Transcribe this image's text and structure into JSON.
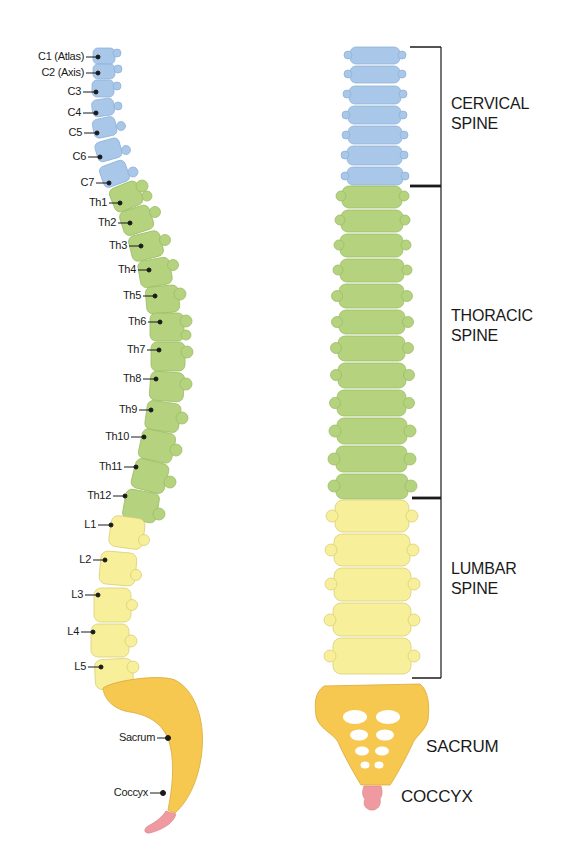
{
  "colors": {
    "cervical": "#a9c7e8",
    "cervical_edge": "#8fb2d8",
    "thoracic": "#b5d27e",
    "thoracic_edge": "#9cbd66",
    "lumbar": "#f7ef9a",
    "lumbar_edge": "#d9cf76",
    "sacrum": "#f6c84f",
    "sacrum_edge": "#d9a93a",
    "coccyx": "#ef9aa0",
    "bracket": "#1a1a1a"
  },
  "side_view": {
    "labels": [
      {
        "id": "c1",
        "text": "C1 (Atlas)"
      },
      {
        "id": "c2",
        "text": "C2 (Axis)"
      },
      {
        "id": "c3",
        "text": "C3"
      },
      {
        "id": "c4",
        "text": "C4"
      },
      {
        "id": "c5",
        "text": "C5"
      },
      {
        "id": "c6",
        "text": "C6"
      },
      {
        "id": "c7",
        "text": "C7"
      },
      {
        "id": "th1",
        "text": "Th1"
      },
      {
        "id": "th2",
        "text": "Th2"
      },
      {
        "id": "th3",
        "text": "Th3"
      },
      {
        "id": "th4",
        "text": "Th4"
      },
      {
        "id": "th5",
        "text": "Th5"
      },
      {
        "id": "th6",
        "text": "Th6"
      },
      {
        "id": "th7",
        "text": "Th7"
      },
      {
        "id": "th8",
        "text": "Th8"
      },
      {
        "id": "th9",
        "text": "Th9"
      },
      {
        "id": "th10",
        "text": "Th10"
      },
      {
        "id": "th11",
        "text": "Th11"
      },
      {
        "id": "th12",
        "text": "Th12"
      },
      {
        "id": "l1",
        "text": "L1"
      },
      {
        "id": "l2",
        "text": "L2"
      },
      {
        "id": "l3",
        "text": "L3"
      },
      {
        "id": "l4",
        "text": "L4"
      },
      {
        "id": "l5",
        "text": "L5"
      },
      {
        "id": "sacrum",
        "text": "Sacrum"
      },
      {
        "id": "coccyx",
        "text": "Coccyx"
      }
    ]
  },
  "front_view": {
    "regions": [
      {
        "id": "cervical",
        "line1": "CERVICAL",
        "line2": "SPINE",
        "vertebra_count": 7
      },
      {
        "id": "thoracic",
        "line1": "THORACIC",
        "line2": "SPINE",
        "vertebra_count": 12
      },
      {
        "id": "lumbar",
        "line1": "LUMBAR",
        "line2": "SPINE",
        "vertebra_count": 5
      }
    ],
    "sacrum_label": "SACRUM",
    "coccyx_label": "COCCYX"
  }
}
